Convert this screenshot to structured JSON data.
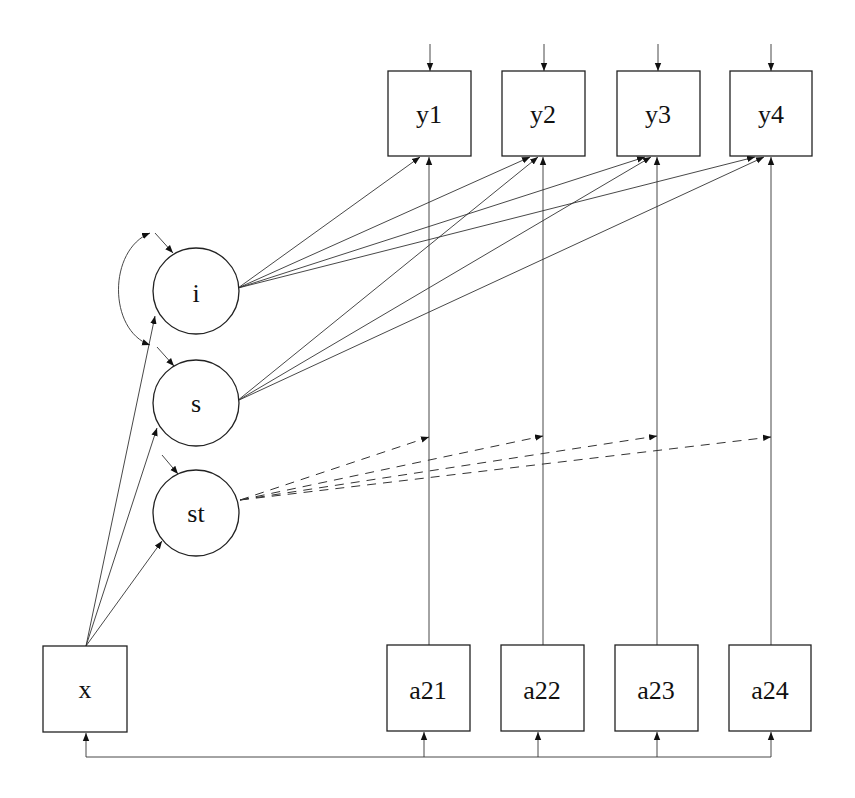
{
  "diagram": {
    "type": "path-diagram",
    "nodes": {
      "y1": {
        "label": "y1",
        "shape": "rect"
      },
      "y2": {
        "label": "y2",
        "shape": "rect"
      },
      "y3": {
        "label": "y3",
        "shape": "rect"
      },
      "y4": {
        "label": "y4",
        "shape": "rect"
      },
      "i": {
        "label": "i",
        "shape": "circle"
      },
      "s": {
        "label": "s",
        "shape": "circle"
      },
      "st": {
        "label": "st",
        "shape": "circle"
      },
      "x": {
        "label": "x",
        "shape": "rect"
      },
      "a21": {
        "label": "a21",
        "shape": "rect"
      },
      "a22": {
        "label": "a22",
        "shape": "rect"
      },
      "a23": {
        "label": "a23",
        "shape": "rect"
      },
      "a24": {
        "label": "a24",
        "shape": "rect"
      }
    },
    "edges": [
      {
        "from": "i",
        "to": "y1",
        "style": "solid"
      },
      {
        "from": "i",
        "to": "y2",
        "style": "solid"
      },
      {
        "from": "i",
        "to": "y3",
        "style": "solid"
      },
      {
        "from": "i",
        "to": "y4",
        "style": "solid"
      },
      {
        "from": "s",
        "to": "y2",
        "style": "solid"
      },
      {
        "from": "s",
        "to": "y3",
        "style": "solid"
      },
      {
        "from": "s",
        "to": "y4",
        "style": "solid"
      },
      {
        "from": "a21",
        "to": "y1",
        "style": "solid"
      },
      {
        "from": "a22",
        "to": "y2",
        "style": "solid"
      },
      {
        "from": "a23",
        "to": "y3",
        "style": "solid"
      },
      {
        "from": "a24",
        "to": "y4",
        "style": "solid"
      },
      {
        "from": "st",
        "to": "a21->y1",
        "style": "dashed"
      },
      {
        "from": "st",
        "to": "a22->y2",
        "style": "dashed"
      },
      {
        "from": "st",
        "to": "a23->y3",
        "style": "dashed"
      },
      {
        "from": "st",
        "to": "a24->y4",
        "style": "dashed"
      },
      {
        "from": "x",
        "to": "i",
        "style": "solid"
      },
      {
        "from": "x",
        "to": "s",
        "style": "solid"
      },
      {
        "from": "x",
        "to": "st",
        "style": "solid"
      },
      {
        "from": "i",
        "to": "s",
        "style": "curved-covariance"
      },
      {
        "from": "x",
        "to": "a21",
        "style": "covariance-bus"
      },
      {
        "from": "x",
        "to": "a22",
        "style": "covariance-bus"
      },
      {
        "from": "x",
        "to": "a23",
        "style": "covariance-bus"
      },
      {
        "from": "x",
        "to": "a24",
        "style": "covariance-bus"
      }
    ],
    "residual_arrows": [
      "y1",
      "y2",
      "y3",
      "y4"
    ],
    "colors": {
      "stroke": "#222222",
      "background": "#ffffff"
    }
  }
}
